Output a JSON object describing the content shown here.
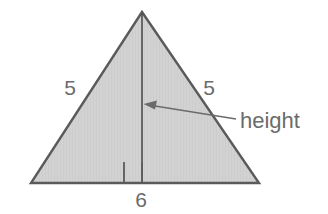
{
  "figure": {
    "kind": "geometry-diagram",
    "background_color": "#ffffff",
    "canvas": {
      "width": 328,
      "height": 214
    }
  },
  "shape": {
    "name": "triangle",
    "fill_color": "#d2d2d2",
    "stroke_color": "#5a5a5a",
    "stroke_width": 2.4,
    "vertices": {
      "apex": {
        "x": 142,
        "y": 12
      },
      "base_left": {
        "x": 31,
        "y": 183
      },
      "base_right": {
        "x": 259,
        "y": 183
      }
    }
  },
  "height_segment": {
    "stroke_color": "#4f4f4f",
    "stroke_width": 1.6,
    "from": {
      "x": 142,
      "y": 12
    },
    "to": {
      "x": 142,
      "y": 183
    }
  },
  "right_angle_marker": {
    "stroke_color": "#5a5a5a",
    "stroke_width": 1.8,
    "left": 124,
    "right": 142,
    "top": 162,
    "bottom": 183
  },
  "callout": {
    "label": "height",
    "text_color": "#6b6b6b",
    "text_x": 240,
    "text_baseline_y": 128,
    "leader_color": "#6b6b6b",
    "leader_width": 1.6,
    "arrow_tip": {
      "x": 144,
      "y": 104
    },
    "leader_tail": {
      "x": 236,
      "y": 119
    },
    "arrowhead_color": "#6b6b6b"
  },
  "labels": [
    {
      "id": "left-leg-length",
      "text": "5",
      "x": 70,
      "y": 95,
      "anchor": "middle",
      "color": "#6b6b6b",
      "describes": "left slanted side"
    },
    {
      "id": "right-leg-length",
      "text": "5",
      "x": 209,
      "y": 95,
      "anchor": "middle",
      "color": "#6b6b6b",
      "describes": "right slanted side"
    },
    {
      "id": "base-length",
      "text": "6",
      "x": 141,
      "y": 207,
      "anchor": "middle",
      "color": "#6b6b6b",
      "describes": "bottom base side"
    }
  ]
}
